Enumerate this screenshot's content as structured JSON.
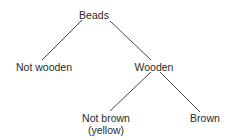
{
  "diagram": {
    "type": "tree",
    "nodes": [
      {
        "id": "beads",
        "label": "Beads",
        "sublabel": null
      },
      {
        "id": "not_wooden",
        "label": "Not wooden",
        "sublabel": null
      },
      {
        "id": "wooden",
        "label": "Wooden",
        "sublabel": null
      },
      {
        "id": "not_brown",
        "label": "Not brown",
        "sublabel": "(yellow)"
      },
      {
        "id": "brown",
        "label": "Brown",
        "sublabel": null
      }
    ],
    "edges": [
      {
        "from": "beads",
        "to": "not_wooden"
      },
      {
        "from": "beads",
        "to": "wooden"
      },
      {
        "from": "wooden",
        "to": "not_brown"
      },
      {
        "from": "wooden",
        "to": "brown"
      }
    ],
    "colors": {
      "line": "#333333",
      "text": "#2a2a2a",
      "background": "#ffffff"
    }
  }
}
